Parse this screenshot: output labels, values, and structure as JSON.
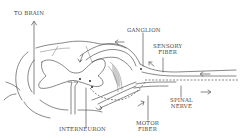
{
  "diagram": {
    "labels": {
      "to_brain": "TO BRAIN",
      "ganglion": "GANGLION",
      "sensory_fiber_line1": "SENSORY",
      "sensory_fiber_line2": "FIBER",
      "spinal_nerve_line1": "SPINAL",
      "spinal_nerve_line2": "NERVE",
      "interneuron": "INTERNEURON",
      "motor_fiber_line1": "MOTOR",
      "motor_fiber_line2": "FIBER"
    },
    "arrows": [
      {
        "name": "to-brain-arrow",
        "direction": "up"
      },
      {
        "name": "sensory-inflow-arrow",
        "direction": "left"
      },
      {
        "name": "ganglion-arrow",
        "direction": "up-left"
      },
      {
        "name": "spinal-nerve-inflow-arrow",
        "direction": "left"
      },
      {
        "name": "spinal-nerve-outflow-arrow",
        "direction": "right"
      },
      {
        "name": "motor-outflow-arrow",
        "direction": "up-right"
      },
      {
        "name": "dorsal-horn-arrow",
        "direction": "down"
      },
      {
        "name": "ventral-arrow",
        "direction": "right"
      }
    ],
    "colors": {
      "line": "#555555",
      "text": "#444444",
      "background": "#ffffff"
    }
  }
}
